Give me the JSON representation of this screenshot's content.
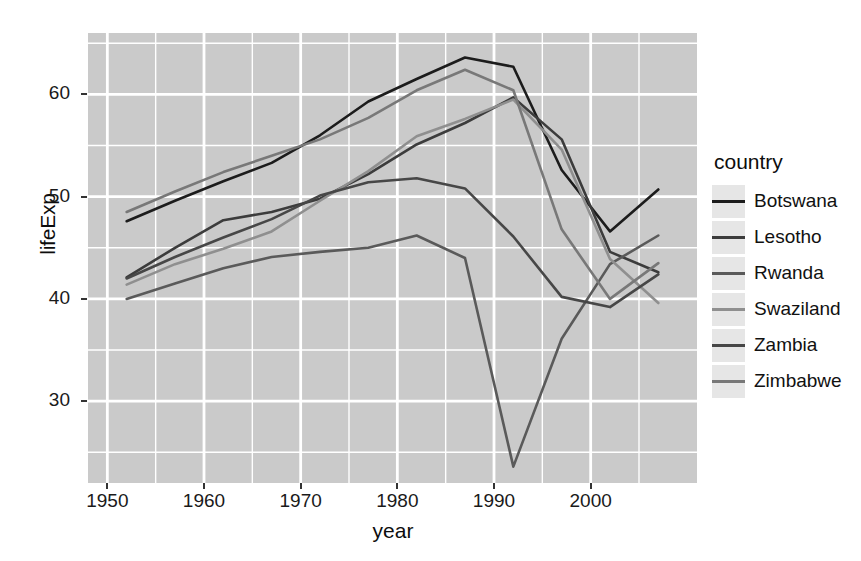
{
  "chart_data": {
    "type": "line",
    "title": "",
    "xlabel": "year",
    "ylabel": "lifeExp",
    "xlim": [
      1948,
      2011
    ],
    "ylim": [
      22,
      66
    ],
    "grid": true,
    "legend_position": "right",
    "legend_title": "country",
    "x_ticks": [
      1950,
      1960,
      1970,
      1980,
      1990,
      2000
    ],
    "y_ticks": [
      30,
      40,
      50,
      60
    ],
    "x": [
      1952,
      1957,
      1962,
      1967,
      1972,
      1977,
      1982,
      1987,
      1992,
      1997,
      2002,
      2007
    ],
    "series": [
      {
        "name": "Botswana",
        "color": "#1c1c1c",
        "values": [
          47.6,
          49.6,
          51.5,
          53.3,
          56.0,
          59.3,
          61.5,
          63.6,
          62.7,
          52.6,
          46.6,
          50.7
        ]
      },
      {
        "name": "Lesotho",
        "color": "#3c3c3c",
        "values": [
          42.1,
          45.0,
          47.7,
          48.5,
          49.8,
          52.2,
          55.1,
          57.2,
          59.7,
          55.6,
          44.6,
          42.6
        ]
      },
      {
        "name": "Rwanda",
        "color": "#5a5a5a",
        "values": [
          40.0,
          41.5,
          43.0,
          44.1,
          44.6,
          45.0,
          46.2,
          44.0,
          23.6,
          36.1,
          43.4,
          46.2
        ]
      },
      {
        "name": "Swaziland",
        "color": "#8f8f8f",
        "values": [
          41.4,
          43.4,
          44.9,
          46.6,
          49.6,
          52.5,
          55.9,
          57.6,
          59.5,
          54.6,
          43.9,
          39.6
        ]
      },
      {
        "name": "Zambia",
        "color": "#474747",
        "values": [
          42.0,
          44.1,
          46.0,
          47.8,
          50.1,
          51.4,
          51.8,
          50.8,
          46.1,
          40.2,
          39.2,
          42.4
        ]
      },
      {
        "name": "Zimbabwe",
        "color": "#787878",
        "values": [
          48.5,
          50.5,
          52.4,
          54.0,
          55.6,
          57.7,
          60.4,
          62.4,
          60.4,
          46.8,
          40.0,
          43.5
        ]
      }
    ]
  },
  "axes": {
    "y_title": "lifeExp",
    "x_title": "year",
    "x_tick_labels": [
      "1950",
      "1960",
      "1970",
      "1980",
      "1990",
      "2000"
    ],
    "y_tick_labels": [
      "30",
      "40",
      "50",
      "60"
    ]
  },
  "legend": {
    "title": "country",
    "items": [
      {
        "label": "Botswana",
        "color": "#1c1c1c"
      },
      {
        "label": "Lesotho",
        "color": "#3c3c3c"
      },
      {
        "label": "Rwanda",
        "color": "#5a5a5a"
      },
      {
        "label": "Swaziland",
        "color": "#8f8f8f"
      },
      {
        "label": "Zambia",
        "color": "#474747"
      },
      {
        "label": "Zimbabwe",
        "color": "#787878"
      }
    ]
  },
  "style": {
    "panel_background": "#cacaca",
    "gridline_color": "#ffffff",
    "legend_key_background": "#e6e6e6",
    "axis_text_color": "#1a1a1a"
  }
}
